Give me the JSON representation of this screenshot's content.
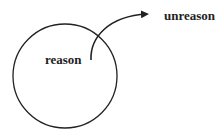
{
  "diagram": {
    "inner_label": "reason",
    "outer_label": "unreason",
    "stroke_color": "#222222",
    "background": "#ffffff"
  }
}
